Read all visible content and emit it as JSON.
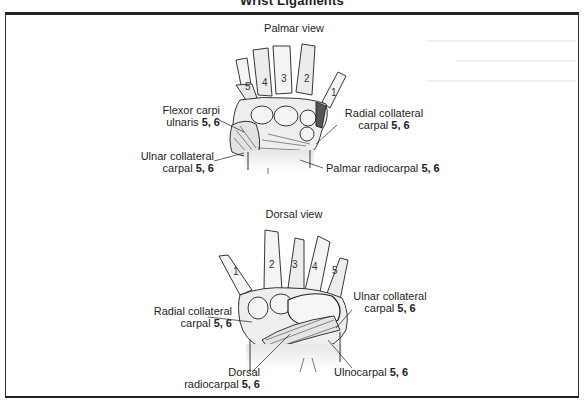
{
  "figure": {
    "title": "Wrist Ligaments"
  },
  "palmar": {
    "view_title": "Palmar view",
    "digits": [
      "5",
      "4",
      "3",
      "2",
      "1"
    ],
    "labels": [
      {
        "name": "Flexor carpi ulnaris",
        "line1": "Flexor carpi",
        "line2": "ulnaris",
        "refs": "5, 6"
      },
      {
        "name": "Radial collateral carpal",
        "line1": "Radial collateral",
        "line2": "carpal",
        "refs": "5, 6"
      },
      {
        "name": "Ulnar collateral carpal",
        "line1": "Ulnar collateral",
        "line2": "carpal",
        "refs": "5, 6"
      },
      {
        "name": "Palmar radiocarpal",
        "line1": "Palmar radiocarpal",
        "refs": "5, 6"
      }
    ]
  },
  "dorsal": {
    "view_title": "Dorsal view",
    "digits": [
      "1",
      "2",
      "3",
      "4",
      "5"
    ],
    "labels": [
      {
        "name": "Ulnar collateral carpal",
        "line1": "Ulnar collateral",
        "line2": "carpal",
        "refs": "5, 6"
      },
      {
        "name": "Radial collateral carpal",
        "line1": "Radial collateral",
        "line2": "carpal",
        "refs": "5, 6"
      },
      {
        "name": "Dorsal radiocarpal",
        "line1": "Dorsal",
        "line2": "radiocarpal",
        "refs": "5, 6"
      },
      {
        "name": "Ulnocarpal",
        "line1": "Ulnocarpal",
        "refs": "5, 6"
      }
    ]
  },
  "colors": {
    "line": "#231f20",
    "bone_fill": "#f4f4f4",
    "shade": "#d9d9d9",
    "frame": "#222222"
  }
}
